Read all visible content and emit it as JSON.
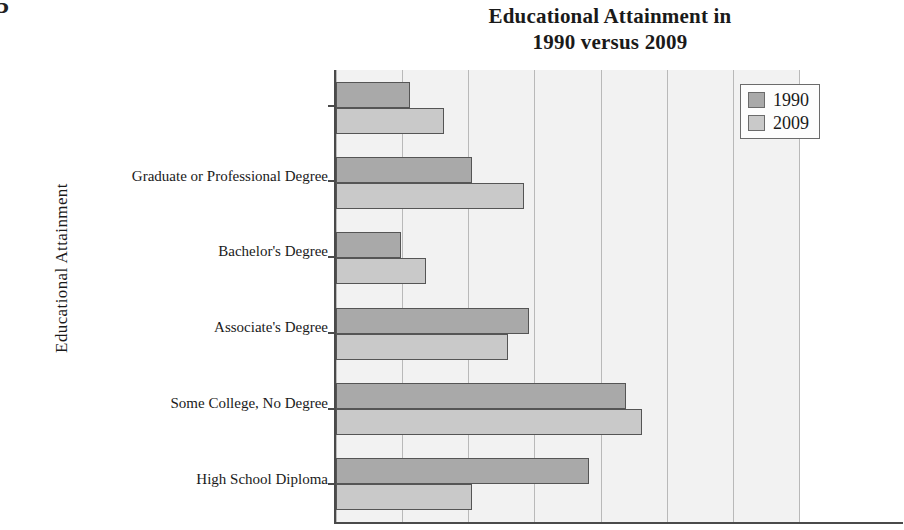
{
  "page": {
    "corner_mark": "5"
  },
  "chart_data": {
    "type": "bar",
    "orientation": "horizontal",
    "title": "Educational Attainment in 1990 versus 2009",
    "title_lines": [
      "Educational Attainment in",
      "1990 versus 2009"
    ],
    "xlabel": "",
    "ylabel": "Educational Attainment",
    "categories": [
      "Graduate or Professional Degree",
      "Bachelor's Degree",
      "Associate's Degree",
      "Some College, No Degree",
      "High School Diploma",
      "Not a High School Graduate"
    ],
    "series": [
      {
        "name": "1990",
        "color": "#a9a9a9",
        "values": [
          5.6,
          10.3,
          4.9,
          14.6,
          21.9,
          19.1
        ]
      },
      {
        "name": "2009",
        "color": "#c9c9c9",
        "values": [
          8.2,
          14.2,
          6.8,
          13.0,
          23.1,
          10.3
        ]
      }
    ],
    "xlim": [
      0,
      35
    ],
    "xticks": [
      0,
      5,
      10,
      15,
      20,
      25,
      30,
      35
    ],
    "grid": true,
    "grid_axis": "x",
    "legend_position": "top-right",
    "plot_background": "#f2f2f2",
    "gridline_color": "#b9b9b9",
    "axis_color": "#4a4a4a"
  },
  "legend": {
    "entries": [
      {
        "label": "1990"
      },
      {
        "label": "2009"
      }
    ]
  }
}
